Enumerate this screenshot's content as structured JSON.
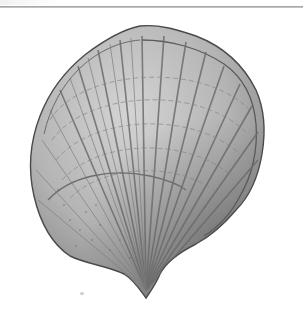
{
  "image": {
    "subject": "scallop shell illustration",
    "description": "Grayscale engraving-style drawing of a fan-shaped bivalve shell with radiating ribs and concentric growth lines",
    "colors": {
      "background": "#ffffff",
      "shell_light": "#c9c9c9",
      "shell_mid": "#9c9c9c",
      "shell_dark": "#5e5e5e",
      "outline": "#4a4a4a",
      "rule": "#a5a5a5"
    }
  }
}
